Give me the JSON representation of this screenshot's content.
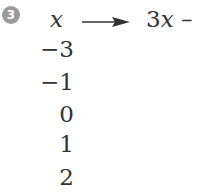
{
  "exercise": {
    "number": "3",
    "input_var": "x",
    "output_expr_prefix": "3",
    "output_expr_var": "x",
    "output_expr_suffix": " –",
    "input_values": [
      "−3",
      "−1",
      "0",
      "1",
      "2"
    ]
  },
  "colors": {
    "badge": "#9a9a9a",
    "text": "#333333"
  }
}
